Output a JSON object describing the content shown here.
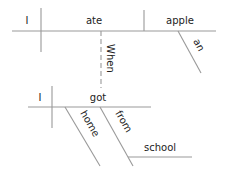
{
  "diagram": {
    "type": "sentence-diagram",
    "clauses": [
      {
        "id": "main-clause",
        "subject": "I",
        "verb": "ate",
        "object": "apple",
        "modifiers": [
          {
            "word": "an",
            "modifies": "apple",
            "kind": "article"
          }
        ]
      },
      {
        "id": "subordinate-clause",
        "subject": "I",
        "verb": "got",
        "modifiers": [
          {
            "word": "home",
            "modifies": "got",
            "kind": "adverb"
          },
          {
            "word": "from",
            "modifies": "got",
            "kind": "preposition",
            "object": "school"
          }
        ]
      }
    ],
    "connector": {
      "word": "When",
      "links": [
        "ate",
        "got"
      ],
      "style": "dashed"
    }
  },
  "labels": {
    "main_subject": "I",
    "main_verb": "ate",
    "main_object": "apple",
    "article": "an",
    "connector": "When",
    "sub_subject": "I",
    "sub_verb": "got",
    "adverb": "home",
    "preposition": "from",
    "prep_object": "school"
  },
  "colors": {
    "line": "#999999",
    "text": "#222222",
    "background": "#ffffff"
  }
}
